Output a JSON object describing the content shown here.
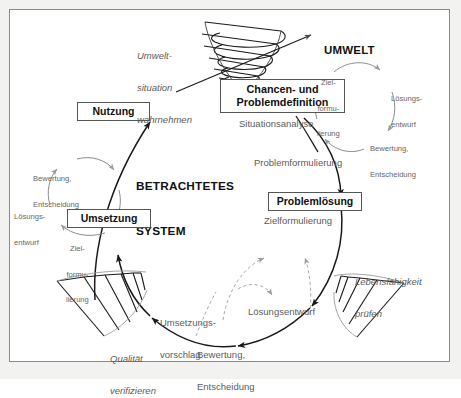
{
  "diagram": {
    "title": "BETRACHTETES SYSTEM",
    "center_label_line1": "BETRACHTETES",
    "center_label_line2": "SYSTEM",
    "environment_label": "UMWELT",
    "frame_color": "#8a8a8a",
    "ink_color": "#1a1a1a",
    "muted_color": "#5c5c5c"
  },
  "phase_boxes": [
    {
      "id": "nutzung",
      "label": "Nutzung"
    },
    {
      "id": "chancen-problemdefinition",
      "label_line1": "Chancen- und",
      "label_line2": "Problemdefinition"
    },
    {
      "id": "problemloesung",
      "label": "Problemlösung"
    },
    {
      "id": "umsetzung",
      "label": "Umsetzung"
    }
  ],
  "flow_labels": [
    {
      "id": "umweltsituation-wahrnehmen",
      "line1": "Umwelt-",
      "line2": "situation",
      "line3": "wahrnehmen"
    },
    {
      "id": "situationsanalyse",
      "text": "Situationsanalyse"
    },
    {
      "id": "problemformulierung",
      "text": "Problemformulierung"
    },
    {
      "id": "lebensfaehigkeit-pruefen",
      "line1": "Lebensfähigkeit",
      "line2": "prüfen"
    },
    {
      "id": "bewertung-entscheidung-unten",
      "line1": "Bewertung,",
      "line2": "Entscheidung"
    },
    {
      "id": "umsetzungsvorschlag",
      "line1": "Umsetzungs-",
      "line2": "vorschlag"
    },
    {
      "id": "qualitaet-verifizieren",
      "line1": "Qualität",
      "line2": "verifizieren"
    }
  ],
  "subcycle_umwelt": {
    "steps": [
      {
        "id": "zielformulierung",
        "line1": "Ziel-",
        "line2": "formu-",
        "line3": "lierung"
      },
      {
        "id": "loesungsentwurf",
        "line1": "Lösungs-",
        "line2": "entwurf"
      },
      {
        "id": "bewertung-entscheidung",
        "line1": "Bewertung,",
        "line2": "Entscheidung"
      }
    ]
  },
  "subcycle_problemloesung": {
    "steps": [
      {
        "id": "zielformulierung",
        "text": "Zielformulierung"
      },
      {
        "id": "loesungsentwurf",
        "text": "Lösungsentwurf"
      },
      {
        "id": "bewertung-entscheidung",
        "line1": "Bewertung,",
        "line2": "Entscheidung"
      }
    ]
  },
  "subcycle_umsetzung": {
    "steps": [
      {
        "id": "zielformulierung",
        "line1": "Ziel-",
        "line2": "formu-",
        "line3": "lierung"
      },
      {
        "id": "loesungsentwurf",
        "line1": "Lösungs-",
        "line2": "entwurf"
      },
      {
        "id": "bewertung-entscheidung",
        "line1": "Bewertung,",
        "line2": "Entscheidung"
      }
    ]
  }
}
